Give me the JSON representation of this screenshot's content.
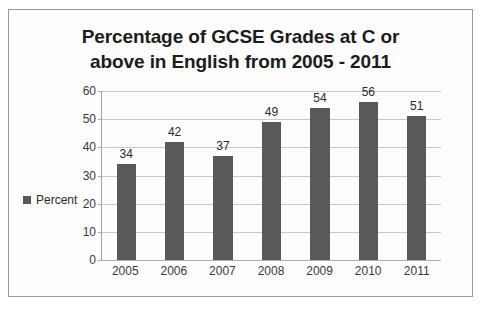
{
  "chart_data": {
    "type": "bar",
    "title": "Percentage of GCSE Grades at C or above in English from 2005 - 2011",
    "title_lines": [
      "Percentage of GCSE Grades at C or",
      "above in English from 2005 - 2011"
    ],
    "categories": [
      "2005",
      "2006",
      "2007",
      "2008",
      "2009",
      "2010",
      "2011"
    ],
    "values": [
      34,
      42,
      37,
      49,
      54,
      56,
      51
    ],
    "series": [
      {
        "name": "Percent",
        "values": [
          34,
          42,
          37,
          49,
          54,
          56,
          51
        ]
      }
    ],
    "xlabel": "",
    "ylabel": "",
    "ylim": [
      0,
      60
    ],
    "yticks": [
      0,
      10,
      20,
      30,
      40,
      50,
      60
    ],
    "ytick_labels": [
      "0",
      "10",
      "20",
      "30",
      "40",
      "50",
      "60"
    ],
    "grid": true,
    "data_labels": true,
    "legend": {
      "position": "left",
      "entries": [
        {
          "label": "Percent",
          "color": "#595959",
          "marker": "square"
        }
      ]
    },
    "colors": {
      "bar": "#595959",
      "gridline": "#c9c9c9",
      "axis": "#a6a6a6",
      "text": "#2b2b2b",
      "background": "#fdfdfd",
      "border": "#9a9a9a"
    }
  }
}
